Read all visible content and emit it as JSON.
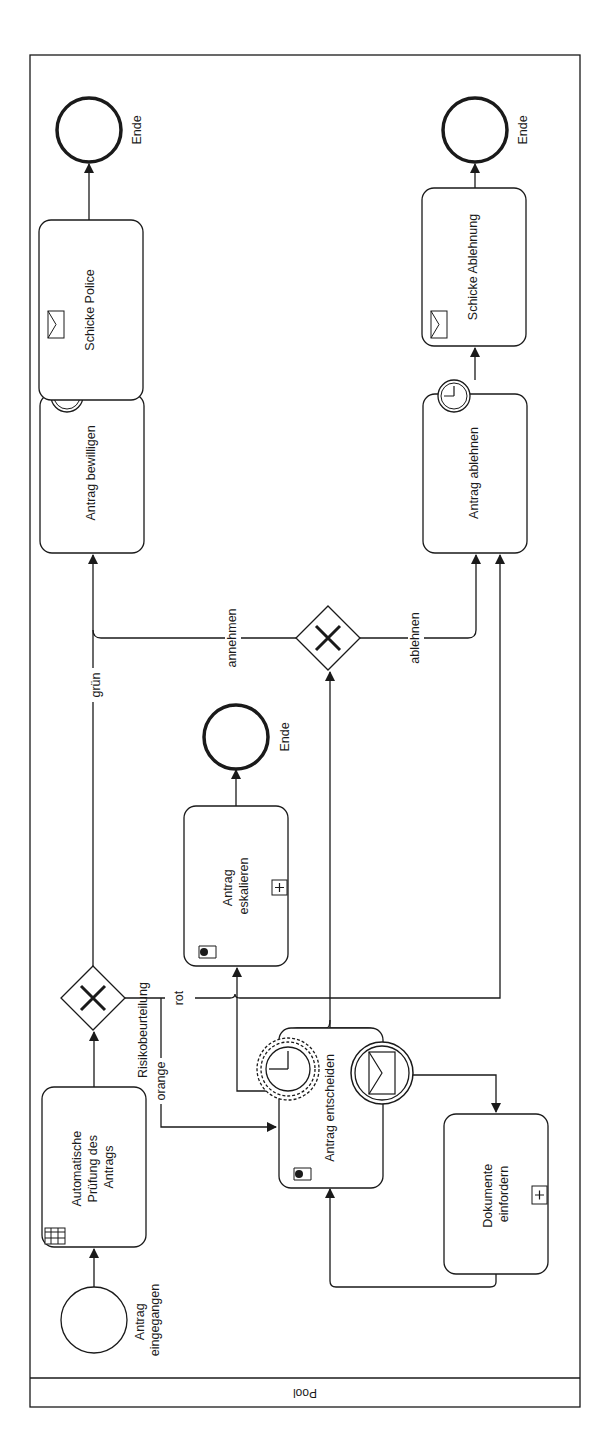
{
  "pool": {
    "label": "Pool"
  },
  "events": {
    "start": {
      "label_line1": "Antrag",
      "label_line2": "eingegangen"
    },
    "end_police": {
      "label": "Ende"
    },
    "end_ablehnung": {
      "label": "Ende"
    },
    "end_eskalation": {
      "label": "Ende"
    }
  },
  "tasks": {
    "automatische_pruefung": {
      "line1": "Automatische",
      "line2": "Prüfung des",
      "line3": "Antrags",
      "type": "business-rule"
    },
    "antrag_entscheiden": {
      "label": "Antrag entscheiden",
      "type": "user"
    },
    "antrag_eskalieren": {
      "line1": "Antrag",
      "line2": "eskalieren",
      "type": "user-subprocess"
    },
    "dokumente_einfordern": {
      "line1": "Dokumente",
      "line2": "einfordern",
      "type": "subprocess"
    },
    "antrag_bewilligen": {
      "label": "Antrag bewilligen"
    },
    "antrag_ablehnen": {
      "label": "Antrag ablehnen"
    },
    "schicke_police": {
      "label": "Schicke Police",
      "type": "send"
    },
    "schicke_ablehnung": {
      "label": "Schicke Ablehnung",
      "type": "send"
    }
  },
  "gateways": {
    "risiko": {
      "label": "Risikobeurteilung",
      "type": "exclusive"
    },
    "entscheidung": {
      "type": "exclusive"
    }
  },
  "flows": {
    "gruen": "grün",
    "orange": "orange",
    "rot": "rot",
    "annehmen": "annehmen",
    "ablehnen": "ablehnen"
  }
}
